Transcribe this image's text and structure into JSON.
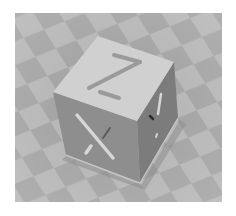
{
  "image": {
    "subject": "3D printing XYZ calibration cube on checkered build plate",
    "style": "grayscale render",
    "cube_labels": {
      "top": "Z",
      "front": "X",
      "right": "Y"
    },
    "colors": {
      "background": "#ffffff",
      "plate_light": "#b4b4b4",
      "plate_dark": "#9c9c9c",
      "top_face": "#d2d2d2",
      "front_face": "#8c8c8c",
      "right_face": "#7a7a7a",
      "letter_inset": "#9a9a9a",
      "letter_light": "#d6d6d6"
    }
  }
}
